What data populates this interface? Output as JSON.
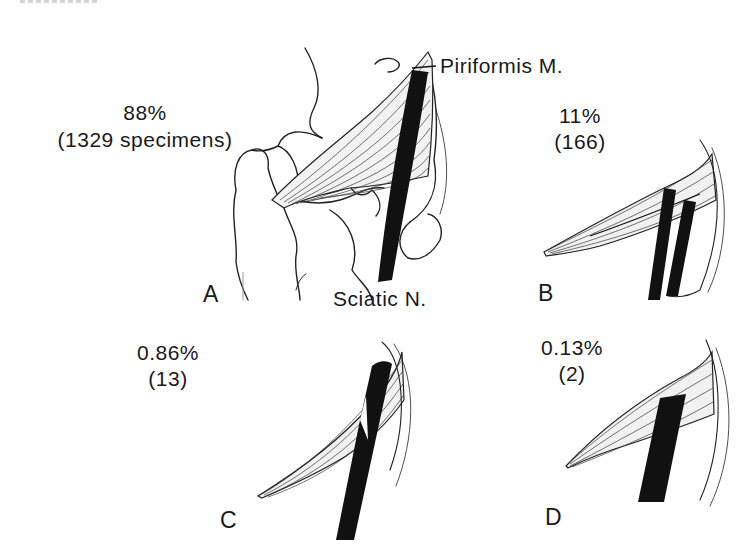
{
  "figure": {
    "structures": {
      "muscle_label": "Piriformis M.",
      "nerve_label": "Sciatic N."
    },
    "panels": [
      {
        "letter": "A",
        "percent": "88%",
        "count": "(1329 specimens)"
      },
      {
        "letter": "B",
        "percent": "11%",
        "count": "(166)"
      },
      {
        "letter": "C",
        "percent": "0.86%",
        "count": "(13)"
      },
      {
        "letter": "D",
        "percent": "0.13%",
        "count": "(2)"
      }
    ],
    "colors": {
      "ink": "#111111",
      "background": "#ffffff"
    }
  }
}
